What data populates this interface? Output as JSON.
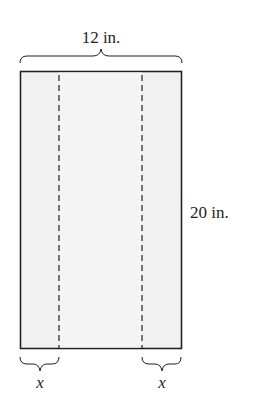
{
  "diagram": {
    "width_label": "12 in.",
    "height_label": "20 in.",
    "left_strip_label": "x",
    "right_strip_label": "x",
    "colors": {
      "fill": "#f1f1f1",
      "stroke": "#231f20"
    }
  }
}
